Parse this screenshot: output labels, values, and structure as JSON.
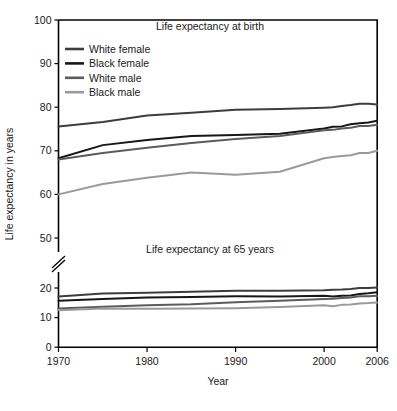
{
  "chart_data": {
    "type": "line",
    "title": "",
    "xlabel": "Year",
    "ylabel": "Life expectancy in years",
    "xlim": [
      1970,
      2006
    ],
    "xticks": [
      1970,
      1980,
      1990,
      2000,
      2006
    ],
    "xticklabels": [
      "1970",
      "1980",
      "1990",
      "2000",
      "2006"
    ],
    "yticks_upper": [
      50,
      60,
      70,
      80,
      90,
      100
    ],
    "yticklabels_upper": [
      "50",
      "60",
      "70",
      "80",
      "90",
      "100"
    ],
    "yticks_lower": [
      0,
      10,
      20
    ],
    "yticklabels_lower": [
      "0",
      "10",
      "20"
    ],
    "axis_break": true,
    "grid": false,
    "legend_position": "upper left",
    "panels": [
      {
        "name": "birth",
        "title": "Life expectancy at birth",
        "series": [
          {
            "name": "White female",
            "color": "#3d3d3d",
            "x": [
              1970,
              1975,
              1980,
              1985,
              1990,
              1995,
              2000,
              2001,
              2002,
              2003,
              2004,
              2005,
              2006
            ],
            "values": [
              75.6,
              76.6,
              78.1,
              78.7,
              79.4,
              79.6,
              79.9,
              80.0,
              80.3,
              80.5,
              80.8,
              80.8,
              80.6
            ]
          },
          {
            "name": "Black female",
            "color": "#171717",
            "x": [
              1970,
              1975,
              1980,
              1985,
              1990,
              1995,
              2000,
              2001,
              2002,
              2003,
              2004,
              2005,
              2006
            ],
            "values": [
              68.3,
              71.3,
              72.5,
              73.4,
              73.6,
              73.9,
              75.1,
              75.5,
              75.6,
              76.1,
              76.3,
              76.5,
              76.9
            ]
          },
          {
            "name": "White male",
            "color": "#5c5c5c",
            "x": [
              1970,
              1975,
              1980,
              1985,
              1990,
              1995,
              2000,
              2001,
              2002,
              2003,
              2004,
              2005,
              2006
            ],
            "values": [
              68.0,
              69.5,
              70.7,
              71.8,
              72.7,
              73.4,
              74.7,
              74.8,
              75.1,
              75.3,
              75.7,
              75.7,
              76.0
            ]
          },
          {
            "name": "Black male",
            "color": "#9a9a9a",
            "x": [
              1970,
              1975,
              1980,
              1985,
              1990,
              1995,
              2000,
              2001,
              2002,
              2003,
              2004,
              2005,
              2006
            ],
            "values": [
              60.0,
              62.4,
              63.8,
              65.0,
              64.5,
              65.2,
              68.3,
              68.6,
              68.8,
              69.0,
              69.5,
              69.5,
              70.0
            ]
          }
        ]
      },
      {
        "name": "at_65",
        "title": "Life expectancy at 65 years",
        "series": [
          {
            "name": "White female",
            "color": "#3d3d3d",
            "x": [
              1970,
              1975,
              1980,
              1985,
              1990,
              1995,
              2000,
              2001,
              2002,
              2003,
              2004,
              2005,
              2006
            ],
            "values": [
              17.1,
              18.1,
              18.4,
              18.7,
              19.1,
              19.1,
              19.2,
              19.4,
              19.5,
              19.7,
              20.0,
              20.0,
              20.2
            ]
          },
          {
            "name": "Black female",
            "color": "#171717",
            "x": [
              1970,
              1975,
              1980,
              1985,
              1990,
              1995,
              2000,
              2001,
              2002,
              2003,
              2004,
              2005,
              2006
            ],
            "values": [
              15.7,
              16.3,
              16.8,
              17.0,
              17.2,
              17.1,
              17.4,
              17.1,
              17.4,
              17.5,
              18.0,
              18.2,
              18.6
            ]
          },
          {
            "name": "White male",
            "color": "#5c5c5c",
            "x": [
              1970,
              1975,
              1980,
              1985,
              1990,
              1995,
              2000,
              2001,
              2002,
              2003,
              2004,
              2005,
              2006
            ],
            "values": [
              13.1,
              13.7,
              14.2,
              14.5,
              15.2,
              15.7,
              16.3,
              16.4,
              16.6,
              16.8,
              17.2,
              17.2,
              17.4
            ]
          },
          {
            "name": "Black male",
            "color": "#9a9a9a",
            "x": [
              1970,
              1975,
              1980,
              1985,
              1990,
              1995,
              2000,
              2001,
              2002,
              2003,
              2004,
              2005,
              2006
            ],
            "values": [
              12.5,
              13.1,
              13.0,
              13.1,
              13.2,
              13.6,
              14.2,
              13.8,
              14.3,
              14.4,
              14.8,
              14.9,
              15.1
            ]
          }
        ]
      }
    ]
  },
  "legend": {
    "items": [
      {
        "label": "White female",
        "color": "#3d3d3d"
      },
      {
        "label": "Black female",
        "color": "#171717"
      },
      {
        "label": "White male",
        "color": "#5c5c5c"
      },
      {
        "label": "Black male",
        "color": "#9a9a9a"
      }
    ]
  },
  "axes": {
    "ylabel": "Life expectancy in years",
    "xlabel": "Year"
  },
  "titles": {
    "upper": "Life expectancy at birth",
    "lower": "Life expectancy at 65 years"
  }
}
